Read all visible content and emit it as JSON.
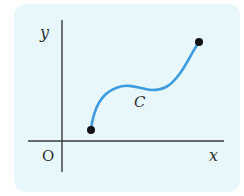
{
  "diagram": {
    "labels": {
      "y_axis": "y",
      "x_axis": "x",
      "origin": "O",
      "curve": "C"
    },
    "colors": {
      "background": "#e8f7fb",
      "curve": "#3d9be0",
      "axes": "#3a3a3a",
      "points": "#111111"
    },
    "curve": {
      "start_point": [
        91,
        130
      ],
      "end_point": [
        199,
        42
      ]
    }
  }
}
